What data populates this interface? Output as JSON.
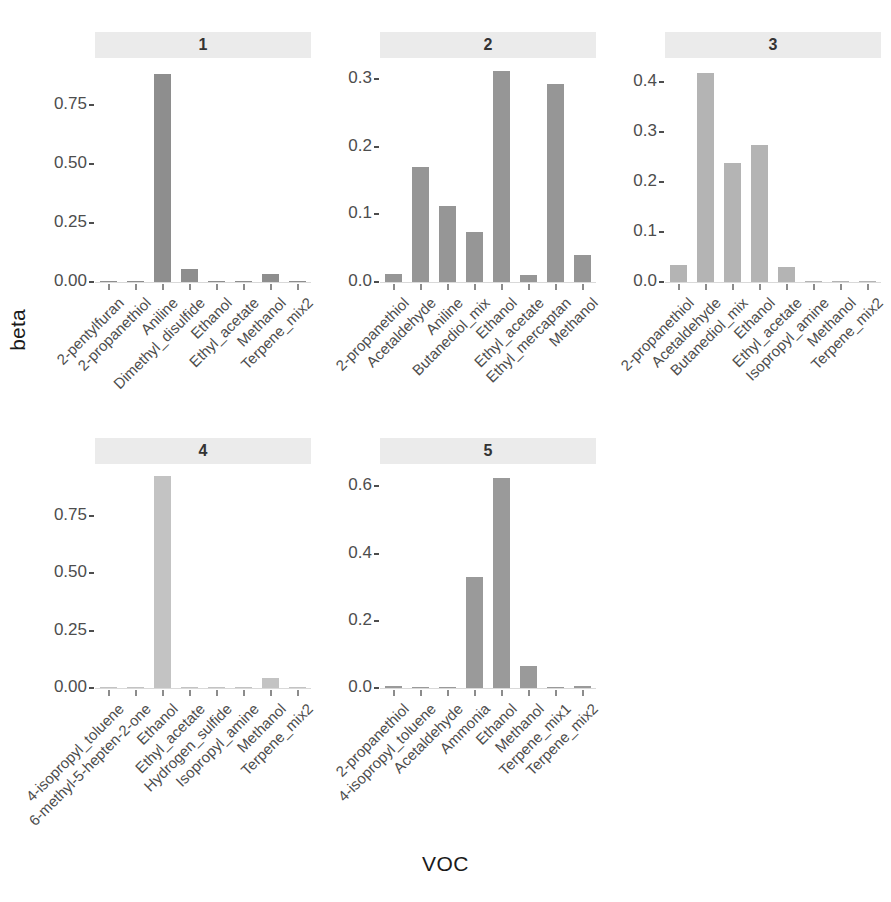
{
  "chart_data": {
    "type": "bar",
    "title": "",
    "xlabel": "VOC",
    "ylabel": "beta",
    "grid": false,
    "legend": "none",
    "facet_layout": "3 columns x 2 rows, free x and y scales",
    "panels": [
      {
        "strip_label": "1",
        "ylim": [
          0,
          0.93
        ],
        "yticks": [
          "0.00",
          "0.25",
          "0.50",
          "0.75"
        ],
        "ytick_values": [
          0,
          0.25,
          0.5,
          0.75
        ],
        "bar_color": "#8e8e8e",
        "categories": [
          "2-pentylfuran",
          "2-propanethiol",
          "Aniline",
          "Dimethyl_disulfide",
          "Ethanol",
          "Ethyl_acetate",
          "Methanol",
          "Terpene_mix2"
        ],
        "values": [
          0.004,
          0.002,
          0.879,
          0.055,
          0.005,
          0.004,
          0.035,
          0.003
        ]
      },
      {
        "strip_label": "2",
        "ylim": [
          0,
          0.325
        ],
        "yticks": [
          "0.0",
          "0.1",
          "0.2",
          "0.3"
        ],
        "ytick_values": [
          0,
          0.1,
          0.2,
          0.3
        ],
        "bar_color": "#969696",
        "categories": [
          "2-propanethiol",
          "Acetaldehyde",
          "Aniline",
          "Butanediol_mix",
          "Ethanol",
          "Ethyl_acetate",
          "Ethyl_mercaptan",
          "Methanol"
        ],
        "values": [
          0.012,
          0.17,
          0.112,
          0.074,
          0.311,
          0.011,
          0.292,
          0.04
        ]
      },
      {
        "strip_label": "3",
        "ylim": [
          0,
          0.44
        ],
        "yticks": [
          "0.0",
          "0.1",
          "0.2",
          "0.3",
          "0.4"
        ],
        "ytick_values": [
          0,
          0.1,
          0.2,
          0.3,
          0.4
        ],
        "bar_color": "#b4b4b4",
        "categories": [
          "2-propanethiol",
          "Acetaldehyde",
          "Butanediol_mix",
          "Ethanol",
          "Ethyl_acetate",
          "Isopropyl_amine",
          "Methanol",
          "Terpene_mix2"
        ],
        "values": [
          0.035,
          0.419,
          0.238,
          0.274,
          0.03,
          0.0,
          0.002,
          0.001
        ]
      },
      {
        "strip_label": "4",
        "ylim": [
          0,
          0.96
        ],
        "yticks": [
          "0.00",
          "0.25",
          "0.50",
          "0.75"
        ],
        "ytick_values": [
          0,
          0.25,
          0.5,
          0.75
        ],
        "bar_color": "#c3c3c3",
        "categories": [
          "4-isopropyl_toluene",
          "6-methyl-5-hepten-2-one",
          "Ethanol",
          "Ethyl_acetate",
          "Hydrogen_sulfide",
          "Isopropyl_amine",
          "Methanol",
          "Terpene_mix2"
        ],
        "values": [
          0.002,
          0.001,
          0.926,
          0.002,
          0.001,
          0.001,
          0.044,
          0.002
        ]
      },
      {
        "strip_label": "5",
        "ylim": [
          0,
          0.655
        ],
        "yticks": [
          "0.0",
          "0.2",
          "0.4",
          "0.6"
        ],
        "ytick_values": [
          0,
          0.2,
          0.4,
          0.6
        ],
        "bar_color": "#9a9a9a",
        "categories": [
          "2-propanethiol",
          "4-isopropyl_toluene",
          "Acetaldehyde",
          "Ammonia",
          "Ethanol",
          "Methanol",
          "Terpene_mix1",
          "Terpene_mix2"
        ],
        "values": [
          0.006,
          0.001,
          0.001,
          0.331,
          0.625,
          0.065,
          0.001,
          0.007
        ]
      }
    ]
  },
  "axis": {
    "y_title": "beta",
    "x_title": "VOC"
  },
  "colors": {
    "strip_background": "#ebebeb",
    "axis_text": "#4d4d4d",
    "axis_line": "#d9d9d9",
    "plot_background": "#ffffff"
  }
}
